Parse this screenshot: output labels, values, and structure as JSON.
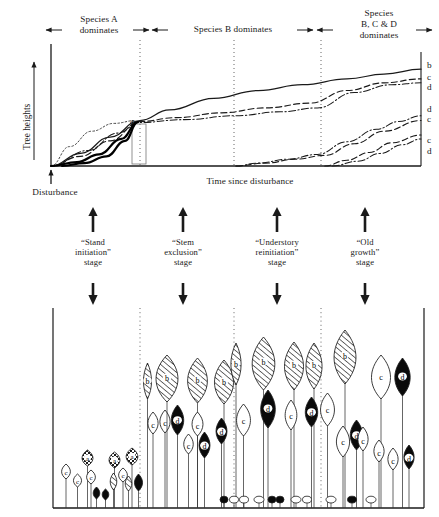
{
  "figure": {
    "title_top_axis_label": "Time since disturbance",
    "y_axis_label": "Tree heights",
    "disturbance_label": "Disturbance",
    "inflection_marker": "a"
  },
  "phase_headers": [
    {
      "id": "species-a",
      "label": "Species A\ndominates",
      "x": 99,
      "y": 14
    },
    {
      "id": "species-b",
      "label": "Species B dominates",
      "x": 233,
      "y": 24
    },
    {
      "id": "species-bcd",
      "label": "Species\nB, C & D\ndominates",
      "x": 379,
      "y": 8
    }
  ],
  "header_arrows": [
    {
      "id": "arrow-left-1",
      "dir": "left",
      "x1": 62,
      "x2": 46,
      "y": 30
    },
    {
      "id": "arrow-right-1",
      "dir": "right",
      "x1": 133,
      "x2": 149,
      "y": 30
    },
    {
      "id": "arrow-left-2",
      "dir": "left",
      "x1": 168,
      "x2": 152,
      "y": 30
    },
    {
      "id": "arrow-right-2",
      "dir": "right",
      "x1": 297,
      "x2": 313,
      "y": 30
    },
    {
      "id": "arrow-left-3",
      "dir": "left",
      "x1": 333,
      "x2": 317,
      "y": 30
    },
    {
      "id": "arrow-right-3",
      "dir": "right",
      "x1": 416,
      "x2": 432,
      "y": 30
    }
  ],
  "curve_end_labels": [
    {
      "id": "label-b-1",
      "text": "b",
      "x": 427,
      "y": 60
    },
    {
      "id": "label-c-1",
      "text": "c",
      "x": 427,
      "y": 72
    },
    {
      "id": "label-d-1",
      "text": "d",
      "x": 427,
      "y": 82
    },
    {
      "id": "label-d-2",
      "text": "d",
      "x": 427,
      "y": 104
    },
    {
      "id": "label-c-2",
      "text": "c",
      "x": 427,
      "y": 114
    },
    {
      "id": "label-c-3",
      "text": "c",
      "x": 427,
      "y": 135
    },
    {
      "id": "label-d-3",
      "text": "d",
      "x": 427,
      "y": 146
    }
  ],
  "stages": [
    {
      "id": "stand-initiation",
      "label": "“Stand\ninitiation”\nstage",
      "x": 93,
      "arrow_x": 93
    },
    {
      "id": "stem-exclusion",
      "label": "“Stem\nexclusion”\nstage",
      "x": 183,
      "arrow_x": 183
    },
    {
      "id": "understory-reinitiation",
      "label": "“Understory\nreinitiation”\nstage",
      "x": 277,
      "arrow_x": 277
    },
    {
      "id": "old-growth",
      "label": "“Old\ngrowth”\nstage",
      "x": 365,
      "arrow_x": 365
    }
  ],
  "dividers_x": [
    140,
    234,
    321
  ],
  "chart": {
    "plot_left": 51,
    "plot_right": 421,
    "plot_top": 48,
    "plot_bottom": 166
  },
  "panel": {
    "left": 53,
    "right": 424,
    "top": 308,
    "ground": 508
  },
  "species_legend": {
    "a": "a",
    "b": "b",
    "c": "c",
    "d": "d"
  },
  "chart_data": {
    "type": "line",
    "xlabel": "Time since disturbance",
    "ylabel": "Tree heights",
    "grid": false,
    "legend": "curve end labels at right axis",
    "annotations": [
      {
        "text": "a",
        "meaning": "point of crown-class differentiation / early convergence"
      },
      {
        "text": "Disturbance",
        "meaning": "stand-replacing event at time zero"
      }
    ],
    "phase_boundaries_x_fraction": [
      0.24,
      0.495,
      0.73
    ],
    "series": [
      {
        "name": "b",
        "style": "solid",
        "end_label": "b",
        "x": [
          0.0,
          0.08,
          0.16,
          0.24,
          0.32,
          0.44,
          0.56,
          0.68,
          0.8,
          0.9,
          1.0
        ],
        "y": [
          0.0,
          0.13,
          0.3,
          0.47,
          0.58,
          0.7,
          0.78,
          0.84,
          0.9,
          0.95,
          1.0
        ]
      },
      {
        "name": "c-upper",
        "style": "dashed",
        "end_label": "c",
        "x": [
          0.0,
          0.08,
          0.16,
          0.24,
          0.34,
          0.46,
          0.58,
          0.7,
          0.8,
          0.9,
          1.0
        ],
        "y": [
          0.0,
          0.1,
          0.26,
          0.46,
          0.5,
          0.55,
          0.6,
          0.65,
          0.78,
          0.86,
          0.9
        ]
      },
      {
        "name": "d-upper",
        "style": "dash-dot",
        "end_label": "d",
        "x": [
          0.0,
          0.1,
          0.18,
          0.24,
          0.36,
          0.5,
          0.62,
          0.72,
          0.82,
          0.92,
          1.0
        ],
        "y": [
          0.0,
          0.16,
          0.34,
          0.45,
          0.48,
          0.52,
          0.56,
          0.6,
          0.76,
          0.84,
          0.86
        ]
      },
      {
        "name": "d-mid",
        "style": "dash-dot",
        "end_label": "d",
        "x": [
          0.5,
          0.56,
          0.64,
          0.72,
          0.8,
          0.88,
          0.94,
          1.0
        ],
        "y": [
          0.0,
          0.03,
          0.07,
          0.12,
          0.25,
          0.38,
          0.46,
          0.52
        ]
      },
      {
        "name": "c-mid",
        "style": "dashed",
        "end_label": "c",
        "x": [
          0.5,
          0.58,
          0.66,
          0.74,
          0.82,
          0.9,
          1.0
        ],
        "y": [
          0.0,
          0.03,
          0.07,
          0.11,
          0.23,
          0.36,
          0.47
        ]
      },
      {
        "name": "c-low",
        "style": "dashed",
        "end_label": "c",
        "x": [
          0.74,
          0.8,
          0.86,
          0.92,
          1.0
        ],
        "y": [
          0.0,
          0.06,
          0.14,
          0.24,
          0.32
        ]
      },
      {
        "name": "d-low",
        "style": "dash-dot",
        "end_label": "d",
        "x": [
          0.76,
          0.83,
          0.89,
          0.95,
          1.0
        ],
        "y": [
          0.0,
          0.05,
          0.13,
          0.22,
          0.28
        ]
      },
      {
        "name": "a-early-dotted",
        "style": "dotted",
        "end_label": "",
        "x": [
          0.0,
          0.05,
          0.11,
          0.17,
          0.23
        ],
        "y": [
          0.0,
          0.2,
          0.36,
          0.44,
          0.47
        ]
      },
      {
        "name": "a-early-thick-1",
        "style": "solid-thick",
        "end_label": "",
        "x": [
          0.0,
          0.07,
          0.13,
          0.19,
          0.235
        ],
        "y": [
          0.0,
          0.04,
          0.12,
          0.28,
          0.455
        ]
      },
      {
        "name": "a-early-thick-2",
        "style": "solid-thick",
        "end_label": "",
        "x": [
          0.03,
          0.09,
          0.15,
          0.2,
          0.235
        ],
        "y": [
          0.0,
          0.03,
          0.1,
          0.26,
          0.455
        ]
      }
    ]
  },
  "forest": {
    "note": "schematic stand cross-section; crowns labelled by species letter",
    "crown_types": {
      "a": "checkered/stippled crown (pioneer, short-lived)",
      "b": "diagonal-hatched crown (dominant canopy)",
      "c": "white/open crown",
      "d": "solid black crown"
    },
    "trees": [
      {
        "sp": "c",
        "x": 60,
        "top": 464,
        "w": 12,
        "h": 15
      },
      {
        "sp": "c",
        "x": 72,
        "top": 474,
        "w": 11,
        "h": 13
      },
      {
        "sp": "a",
        "x": 80,
        "top": 450,
        "w": 15,
        "h": 16
      },
      {
        "sp": "c",
        "x": 85,
        "top": 470,
        "w": 12,
        "h": 14
      },
      {
        "sp": "d",
        "x": 92,
        "top": 487,
        "w": 9,
        "h": 12
      },
      {
        "sp": "d",
        "x": 101,
        "top": 489,
        "w": 9,
        "h": 11
      },
      {
        "sp": "a",
        "x": 107,
        "top": 452,
        "w": 15,
        "h": 16
      },
      {
        "sp": "b",
        "x": 109,
        "top": 473,
        "w": 9,
        "h": 17
      },
      {
        "sp": "c",
        "x": 117,
        "top": 468,
        "w": 12,
        "h": 14
      },
      {
        "sp": "a",
        "x": 124,
        "top": 448,
        "w": 16,
        "h": 17
      },
      {
        "sp": "b",
        "x": 124,
        "top": 476,
        "w": 9,
        "h": 15
      },
      {
        "sp": "d",
        "x": 133,
        "top": 474,
        "w": 11,
        "h": 17
      },
      {
        "sp": "b",
        "x": 142,
        "top": 363,
        "w": 11,
        "h": 36
      },
      {
        "sp": "c",
        "x": 146,
        "top": 412,
        "w": 14,
        "h": 22
      },
      {
        "sp": "c",
        "x": 158,
        "top": 410,
        "w": 14,
        "h": 23
      },
      {
        "sp": "b",
        "x": 152,
        "top": 355,
        "w": 30,
        "h": 47
      },
      {
        "sp": "d",
        "x": 169,
        "top": 405,
        "w": 17,
        "h": 30
      },
      {
        "sp": "b",
        "x": 184,
        "top": 358,
        "w": 27,
        "h": 45
      },
      {
        "sp": "c",
        "x": 190,
        "top": 412,
        "w": 15,
        "h": 24
      },
      {
        "sp": "c",
        "x": 182,
        "top": 434,
        "w": 13,
        "h": 20
      },
      {
        "sp": "d",
        "x": 197,
        "top": 432,
        "w": 15,
        "h": 26
      },
      {
        "sp": "b",
        "x": 211,
        "top": 360,
        "w": 26,
        "h": 44
      },
      {
        "sp": "d",
        "x": 214,
        "top": 418,
        "w": 15,
        "h": 26
      },
      {
        "sp": "b",
        "x": 229,
        "top": 343,
        "w": 14,
        "h": 42
      },
      {
        "sp": "c",
        "x": 234,
        "top": 404,
        "w": 19,
        "h": 32
      },
      {
        "sp": "b",
        "x": 248,
        "top": 337,
        "w": 31,
        "h": 53
      },
      {
        "sp": "d",
        "x": 258,
        "top": 390,
        "w": 20,
        "h": 38
      },
      {
        "sp": "b",
        "x": 281,
        "top": 342,
        "w": 26,
        "h": 48
      },
      {
        "sp": "c",
        "x": 283,
        "top": 400,
        "w": 16,
        "h": 30
      },
      {
        "sp": "b",
        "x": 303,
        "top": 343,
        "w": 22,
        "h": 46
      },
      {
        "sp": "d",
        "x": 303,
        "top": 397,
        "w": 17,
        "h": 30
      },
      {
        "sp": "c",
        "x": 318,
        "top": 393,
        "w": 19,
        "h": 33
      },
      {
        "sp": "b",
        "x": 330,
        "top": 330,
        "w": 30,
        "h": 54
      },
      {
        "sp": "c",
        "x": 334,
        "top": 426,
        "w": 18,
        "h": 31
      },
      {
        "sp": "d",
        "x": 348,
        "top": 420,
        "w": 17,
        "h": 30
      },
      {
        "sp": "c",
        "x": 356,
        "top": 427,
        "w": 14,
        "h": 24
      },
      {
        "sp": "c",
        "x": 368,
        "top": 355,
        "w": 26,
        "h": 44
      },
      {
        "sp": "c",
        "x": 372,
        "top": 440,
        "w": 14,
        "h": 22
      },
      {
        "sp": "d",
        "x": 392,
        "top": 358,
        "w": 21,
        "h": 38
      },
      {
        "sp": "c",
        "x": 386,
        "top": 448,
        "w": 14,
        "h": 22
      },
      {
        "sp": "d",
        "x": 402,
        "top": 445,
        "w": 14,
        "h": 24
      }
    ],
    "shrubs": [
      {
        "x": 224,
        "fill": "black",
        "w": 8
      },
      {
        "x": 234,
        "fill": "white",
        "w": 9
      },
      {
        "x": 244,
        "fill": "white",
        "w": 9
      },
      {
        "x": 259,
        "fill": "white",
        "w": 10
      },
      {
        "x": 272,
        "fill": "black",
        "w": 8
      },
      {
        "x": 280,
        "fill": "black",
        "w": 8
      },
      {
        "x": 296,
        "fill": "white",
        "w": 10
      },
      {
        "x": 307,
        "fill": "white",
        "w": 9
      },
      {
        "x": 331,
        "fill": "white",
        "w": 10
      },
      {
        "x": 352,
        "fill": "black",
        "w": 9
      },
      {
        "x": 371,
        "fill": "white",
        "w": 10
      }
    ]
  }
}
